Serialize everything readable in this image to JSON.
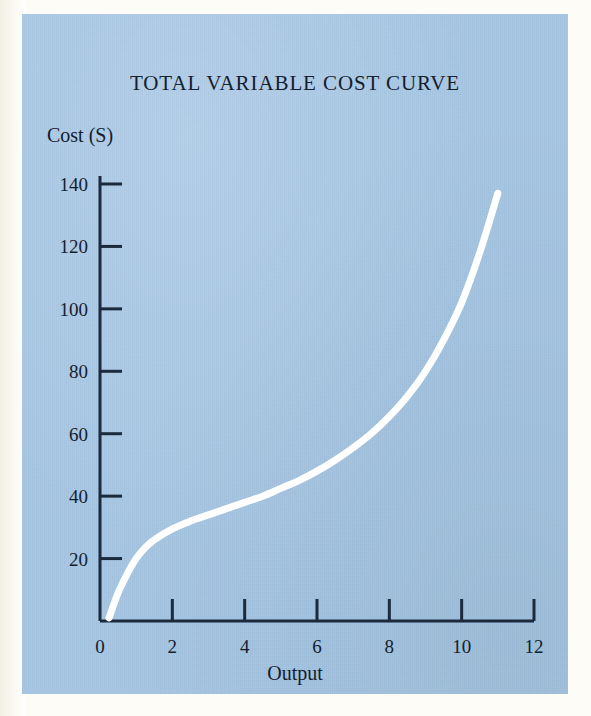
{
  "figure": {
    "panel_color": "#a5c6e4",
    "page_color": "#fdfcf7",
    "curve_color": "#ffffff",
    "axis_color": "#1b2a3c",
    "text_color": "#14202e"
  },
  "chart_data": {
    "type": "line",
    "title": "TOTAL VARIABLE COST CURVE",
    "xlabel": "Output",
    "ylabel": "Cost (S)",
    "xlim": [
      0,
      12
    ],
    "ylim": [
      0,
      140
    ],
    "grid": false,
    "legend": "none",
    "xticks": [
      0,
      2,
      4,
      6,
      8,
      10,
      12
    ],
    "xticklabels": [
      "0",
      "2",
      "4",
      "6",
      "8",
      "10",
      "12"
    ],
    "yticks": [
      20,
      40,
      60,
      80,
      100,
      120,
      140
    ],
    "yticklabels": [
      "20",
      "40",
      "60",
      "80",
      "100",
      "120",
      "140"
    ],
    "series": [
      {
        "name": "Total variable cost",
        "color": "#ffffff",
        "x": [
          0.25,
          0.5,
          0.75,
          1.0,
          1.25,
          1.5,
          2.0,
          2.5,
          3.0,
          3.5,
          4.0,
          4.5,
          5.0,
          5.5,
          6.0,
          6.5,
          7.0,
          7.5,
          8.0,
          8.5,
          9.0,
          9.5,
          10.0,
          10.5,
          11.0
        ],
        "y": [
          1,
          9,
          15,
          20,
          23.5,
          26,
          29.5,
          32,
          34,
          36,
          38,
          40,
          42.5,
          45,
          48,
          51.5,
          55.5,
          60,
          65.5,
          72,
          80,
          90,
          102,
          118,
          137
        ]
      }
    ]
  }
}
